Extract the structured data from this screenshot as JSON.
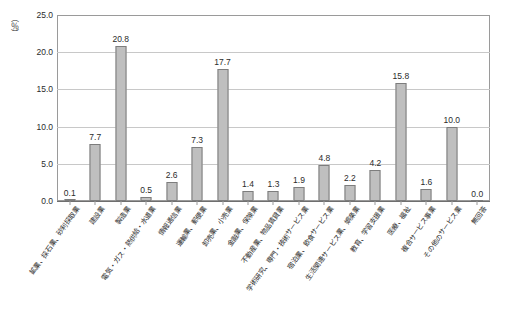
{
  "chart_data": {
    "type": "bar",
    "title": "",
    "subtitle": "",
    "xlabel": "",
    "ylabel": "（％）",
    "unit_label": "（％）",
    "ylim": [
      0,
      25
    ],
    "yticks": [
      "0.0",
      "5.0",
      "10.0",
      "15.0",
      "20.0",
      "25.0"
    ],
    "ytick_values": [
      0,
      5,
      10,
      15,
      20,
      25
    ],
    "grid": true,
    "legend": "none",
    "categories": [
      "鉱業、採石業、砂利採取業",
      "建設業",
      "製造業",
      "電気・ガス・熱供給・水道業",
      "情報通信業",
      "運輸業、郵便業",
      "卸売業、小売業",
      "金融業、保険業",
      "不動産業、物品賃貸業",
      "学術研究、専門・技術サービス業",
      "宿泊業、飲食サービス業",
      "生活関連サービス業、娯楽業",
      "教育、学習支援業",
      "医療、福祉",
      "複合サービス事業",
      "その他のサービス業",
      "無回答"
    ],
    "values": [
      0.1,
      7.7,
      20.8,
      0.5,
      2.6,
      7.3,
      17.7,
      1.4,
      1.3,
      1.9,
      4.8,
      2.2,
      4.2,
      15.8,
      1.6,
      10.0,
      0.0
    ],
    "value_labels": [
      "0.1",
      "7.7",
      "20.8",
      "0.5",
      "2.6",
      "7.3",
      "17.7",
      "1.4",
      "1.3",
      "1.9",
      "4.8",
      "2.2",
      "4.2",
      "15.8",
      "1.6",
      "10.0",
      "0.0"
    ],
    "bar_color": "#bfbfbf",
    "bar_border_color": "#7d7d7d",
    "grid_color": "#c8c8c8",
    "axis_color": "#9a9a9a"
  }
}
